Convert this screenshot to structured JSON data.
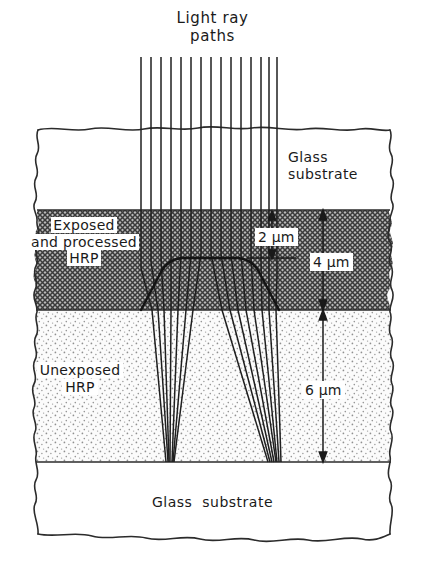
{
  "figure": {
    "title_line1": "Light ray",
    "title_line2": "paths",
    "layers": [
      {
        "id": "glass-top",
        "label_line1": "Glass",
        "label_line2": "substrate",
        "fill": "#ffffff",
        "pattern": "none"
      },
      {
        "id": "exposed-hrp",
        "label_line1": "Exposed",
        "label_line2": "and processed",
        "label_line3": "HRP",
        "fill": "#8a8a8a",
        "pattern": "cross-hatch-dense"
      },
      {
        "id": "unexposed-hrp",
        "label_line1": "Unexposed",
        "label_line2": "HRP",
        "fill": "#f2f2f2",
        "pattern": "stipple"
      },
      {
        "id": "glass-bottom",
        "label": "Glass  substrate",
        "fill": "#ffffff",
        "pattern": "none"
      }
    ],
    "dimensions": [
      {
        "id": "dim-2um",
        "value": "2",
        "unit": "μm",
        "text": "2 μm"
      },
      {
        "id": "dim-4um",
        "value": "4",
        "unit": "μm",
        "text": "4 μm"
      },
      {
        "id": "dim-6um",
        "value": "6",
        "unit": "μm",
        "text": "6 μm"
      }
    ],
    "ray_count": 15,
    "colors": {
      "line": "#1a1a1a",
      "exposed_fill": "#8a8a8a",
      "unexposed_fill": "#f4f4f4",
      "background": "#ffffff"
    }
  }
}
